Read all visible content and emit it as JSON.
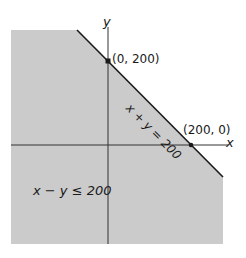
{
  "diagram": {
    "title": "",
    "axes": {
      "x_label": "x",
      "y_label": "y"
    },
    "boundary_line": {
      "label": "x + y = 200"
    },
    "points": [
      {
        "label": "(0, 200)"
      },
      {
        "label": "(200, 0)"
      }
    ],
    "region_label": "x − y ≤ 200",
    "colors": {
      "shade": "#cbcbcb",
      "line": "#1a1a1a",
      "axis": "#333333"
    }
  }
}
